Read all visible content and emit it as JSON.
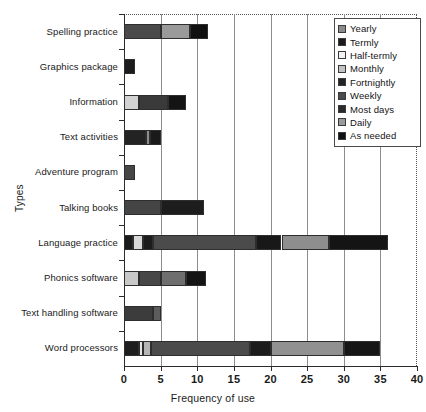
{
  "chart_data": {
    "type": "bar",
    "orientation": "horizontal",
    "stacked": true,
    "title": "",
    "xlabel": "Frequency of use",
    "ylabel": "Types",
    "xlim": [
      0,
      40
    ],
    "xticks": [
      0,
      5,
      10,
      15,
      20,
      25,
      30,
      35,
      40
    ],
    "xticklabels": [
      "0",
      "5",
      "10",
      "15",
      "20",
      "25",
      "30",
      "35",
      "40"
    ],
    "grid": true,
    "grid_axis": "x",
    "legend_position": "upper right",
    "categories": [
      "Spelling practice",
      "Graphics package",
      "Information",
      "Text activities",
      "Adventure program",
      "Talking books",
      "Language practice",
      "Phonics software",
      "Text handling software",
      "Word processors"
    ],
    "series": [
      {
        "name": "Yearly",
        "color": "#8a8a8a",
        "values": [
          0,
          0,
          0,
          0,
          0,
          0,
          0,
          0,
          0,
          0
        ]
      },
      {
        "name": "Termly",
        "color": "#1b1b1b",
        "values": [
          0,
          0,
          0,
          0,
          0,
          0,
          0,
          0,
          0,
          2
        ]
      },
      {
        "name": "Half-termly",
        "color": "#efefef",
        "values": [
          0,
          0,
          2,
          0,
          0,
          0,
          0,
          0,
          0,
          0.6
        ]
      },
      {
        "name": "Monthly",
        "color": "#c2c2c2",
        "values": [
          0,
          0,
          0,
          0,
          0,
          0,
          1.2,
          2,
          0,
          1.1
        ]
      },
      {
        "name": "Fortnightly",
        "color": "#232323",
        "values": [
          0,
          1.5,
          0,
          3,
          0,
          0,
          1.2,
          0,
          0,
          0
        ]
      },
      {
        "name": "Weekly",
        "color": "#4a4a4a",
        "values": [
          5,
          0,
          0,
          0,
          1.5,
          5,
          14,
          3,
          4,
          13.5
        ]
      },
      {
        "name": "Most days",
        "color": "#2a2a2a",
        "values": [
          0,
          0,
          4,
          0,
          0,
          0,
          0,
          0,
          0,
          2.8
        ]
      },
      {
        "name": "Daily",
        "color": "#9a9a9a",
        "values": [
          4,
          0,
          0,
          0.5,
          0,
          0,
          4.6,
          3.5,
          1,
          10
        ]
      },
      {
        "name": "As needed",
        "color": "#101010",
        "values": [
          2.5,
          0,
          2.5,
          1.5,
          0,
          6,
          15,
          2.5,
          0,
          5
        ]
      }
    ],
    "bar_segments": [
      {
        "category": "Spelling practice",
        "segments": [
          {
            "series": "Weekly",
            "start": 0,
            "end": 5,
            "color": "#4a4a4a"
          },
          {
            "series": "Daily",
            "start": 5,
            "end": 9,
            "color": "#9a9a9a"
          },
          {
            "series": "As needed",
            "start": 9,
            "end": 11.5,
            "color": "#101010"
          }
        ],
        "total": 11.5
      },
      {
        "category": "Graphics package",
        "segments": [
          {
            "series": "Fortnightly",
            "start": 0,
            "end": 1.5,
            "color": "#1c1c1c"
          }
        ],
        "total": 1.5
      },
      {
        "category": "Information",
        "segments": [
          {
            "series": "Half-termly",
            "start": 0,
            "end": 2,
            "color": "#d2d2d2"
          },
          {
            "series": "Most days",
            "start": 2,
            "end": 6,
            "color": "#3a3a3a"
          },
          {
            "series": "As needed",
            "start": 6,
            "end": 8.5,
            "color": "#141414"
          }
        ],
        "total": 8.5
      },
      {
        "category": "Text activities",
        "segments": [
          {
            "series": "Fortnightly",
            "start": 0,
            "end": 3,
            "color": "#232323"
          },
          {
            "series": "Daily",
            "start": 3,
            "end": 3.6,
            "color": "#8e8e8e"
          },
          {
            "series": "As needed",
            "start": 3.6,
            "end": 5,
            "color": "#1a1a1a"
          }
        ],
        "total": 5
      },
      {
        "category": "Adventure program",
        "segments": [
          {
            "series": "Weekly",
            "start": 0,
            "end": 1.5,
            "color": "#464646"
          }
        ],
        "total": 1.5
      },
      {
        "category": "Talking books",
        "segments": [
          {
            "series": "Weekly",
            "start": 0,
            "end": 5,
            "color": "#454545"
          },
          {
            "series": "As needed",
            "start": 5,
            "end": 11,
            "color": "#1d1d1d"
          }
        ],
        "total": 11
      },
      {
        "category": "Language practice",
        "segments": [
          {
            "series": "As needed",
            "start": 0,
            "end": 1.2,
            "color": "#1a1a1a"
          },
          {
            "series": "Monthly",
            "start": 1.2,
            "end": 2.6,
            "color": "#d8d8d8"
          },
          {
            "series": "Fortnightly",
            "start": 2.6,
            "end": 4,
            "color": "#1c1c1c"
          },
          {
            "series": "Weekly",
            "start": 4,
            "end": 18,
            "color": "#4b4b4b"
          },
          {
            "series": "As needed",
            "start": 18,
            "end": 21.5,
            "color": "#181818"
          },
          {
            "series": "Daily",
            "start": 21.5,
            "end": 28,
            "color": "#8e8e8e"
          },
          {
            "series": "As needed",
            "start": 28,
            "end": 36,
            "color": "#141414"
          }
        ],
        "total": 36
      },
      {
        "category": "Phonics software",
        "segments": [
          {
            "series": "Monthly",
            "start": 0,
            "end": 2,
            "color": "#c8c8c8"
          },
          {
            "series": "Weekly",
            "start": 2,
            "end": 5,
            "color": "#474747"
          },
          {
            "series": "Daily",
            "start": 5,
            "end": 8.5,
            "color": "#6e6e6e"
          },
          {
            "series": "As needed",
            "start": 8.5,
            "end": 11.2,
            "color": "#141414"
          }
        ],
        "total": 11.2
      },
      {
        "category": "Text handling software",
        "segments": [
          {
            "series": "Weekly",
            "start": 0,
            "end": 4,
            "color": "#3c3c3c"
          },
          {
            "series": "Daily",
            "start": 4,
            "end": 5,
            "color": "#5c5c5c"
          }
        ],
        "total": 5
      },
      {
        "category": "Word processors",
        "segments": [
          {
            "series": "Termly",
            "start": 0,
            "end": 2,
            "color": "#1e1e1e"
          },
          {
            "series": "Half-termly",
            "start": 2,
            "end": 2.6,
            "color": "#e2e2e2"
          },
          {
            "series": "Monthly",
            "start": 2.6,
            "end": 3.7,
            "color": "#b4b4b4"
          },
          {
            "series": "Weekly",
            "start": 3.7,
            "end": 17.2,
            "color": "#4b4b4b"
          },
          {
            "series": "Most days",
            "start": 17.2,
            "end": 20,
            "color": "#1c1c1c"
          },
          {
            "series": "Daily",
            "start": 20,
            "end": 30,
            "color": "#919191"
          },
          {
            "series": "As needed",
            "start": 30,
            "end": 35,
            "color": "#161616"
          }
        ],
        "total": 35
      }
    ]
  },
  "legend": {
    "items": [
      {
        "label": "Yearly",
        "color": "#8a8a8a"
      },
      {
        "label": "Termly",
        "color": "#1b1b1b"
      },
      {
        "label": "Half-termly",
        "color": "#f2f2f2"
      },
      {
        "label": "Monthly",
        "color": "#c2c2c2"
      },
      {
        "label": "Fortnightly",
        "color": "#232323"
      },
      {
        "label": "Weekly",
        "color": "#4a4a4a"
      },
      {
        "label": "Most days",
        "color": "#2a2a2a"
      },
      {
        "label": "Daily",
        "color": "#9a9a9a"
      },
      {
        "label": "As needed",
        "color": "#101010"
      }
    ]
  }
}
